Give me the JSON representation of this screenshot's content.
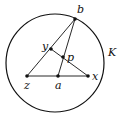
{
  "diagram": {
    "circle": {
      "label": "K",
      "cx": 55,
      "cy": 63,
      "r": 49
    },
    "points": [
      {
        "id": "b",
        "label": "b",
        "x": 75,
        "y": 19,
        "lx": 77,
        "ly": 13
      },
      {
        "id": "y",
        "label": "y",
        "x": 51,
        "y": 49,
        "lx": 42,
        "ly": 49
      },
      {
        "id": "p",
        "label": "p",
        "x": 63,
        "y": 57,
        "lx": 67,
        "ly": 60
      },
      {
        "id": "z",
        "label": "z",
        "x": 27,
        "y": 76,
        "lx": 24,
        "ly": 88
      },
      {
        "id": "a",
        "label": "a",
        "x": 58,
        "y": 76,
        "lx": 55,
        "ly": 88
      },
      {
        "id": "x",
        "label": "x",
        "x": 88,
        "y": 76,
        "lx": 92,
        "ly": 80
      }
    ],
    "segments": [
      [
        "z",
        "b"
      ],
      [
        "a",
        "b"
      ],
      [
        "z",
        "x"
      ],
      [
        "y",
        "x"
      ]
    ]
  }
}
